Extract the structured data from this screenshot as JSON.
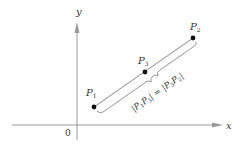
{
  "diagram": {
    "type": "coordinate-plane-midpoint",
    "axes": {
      "x_label": "x",
      "y_label": "y",
      "origin_label": "0"
    },
    "points": [
      {
        "id": "P1",
        "name": "P",
        "sub": "1"
      },
      {
        "id": "P3",
        "name": "P",
        "sub": "3"
      },
      {
        "id": "P2",
        "name": "P",
        "sub": "2"
      }
    ],
    "equation": {
      "left_a": "P",
      "left_a_sub": "1",
      "left_b": "P",
      "left_b_sub": "3",
      "right_a": "P",
      "right_a_sub": "3",
      "right_b": "P",
      "right_b_sub": "2",
      "text": "|P1P3| = |P3P2|"
    },
    "colors": {
      "axis": "#999999",
      "segment": "#888888",
      "point": "#111111",
      "text": "#333333"
    }
  }
}
